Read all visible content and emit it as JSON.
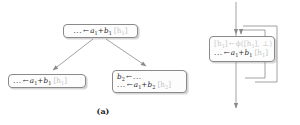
{
  "figure": {
    "background_color": "#ffffff",
    "line_color": "#8a8a8a",
    "text_color": "#1c1c1c",
    "ghost_text_color": "#c9c9c9",
    "tag_color": "#c2c2c2"
  },
  "panel_a": {
    "caption": "(a)",
    "nodes": {
      "root": {
        "line1": {
          "dots": "...",
          "arrow": "←",
          "expr_a": "a",
          "sub_a": "1",
          "plus": "+",
          "expr_b": "b",
          "sub_b": "1",
          "tag": "[h",
          "tag_sub": "1",
          "tag_close": "]"
        }
      },
      "left": {
        "line1": {
          "dots": "...",
          "arrow": "←",
          "expr_a": "a",
          "sub_a": "1",
          "plus": "+",
          "expr_b": "b",
          "sub_b": "1",
          "tag": "[h",
          "tag_sub": "1",
          "tag_close": "]"
        }
      },
      "right": {
        "line1": {
          "expr_b": "b",
          "sub_b": "2",
          "arrow": "←",
          "dots": "..."
        },
        "line2": {
          "dots": "...",
          "arrow": "←",
          "expr_a": "a",
          "sub_a": "1",
          "plus": "+",
          "expr_b": "b",
          "sub_b": "2",
          "tag": "[h",
          "tag_sub": "2",
          "tag_close": "]"
        }
      }
    }
  },
  "panel_b": {
    "caption": "(b)",
    "nodes": {
      "loop": {
        "line_phi": {
          "tag_open": "[h",
          "tag_sub": "1",
          "tag_close": "]",
          "arrow": "←",
          "phi": "ϕ",
          "paren_open": "([h",
          "phi_sub": "1",
          "paren_mid": "], ⊥)"
        },
        "line_instr": {
          "dots": "...",
          "arrow": "←",
          "expr_a": "a",
          "sub_a": "1",
          "plus": "+",
          "expr_b": "b",
          "sub_b": "1",
          "tag": "[h",
          "tag_sub": "1",
          "tag_close": "]"
        }
      }
    }
  }
}
